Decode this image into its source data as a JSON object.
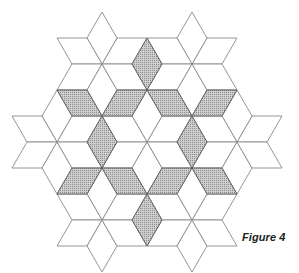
{
  "figure": {
    "caption": "Figure 4",
    "colors": {
      "background": "#ffffff",
      "outline": "#8a8a8a",
      "shade_fill": "#c9c9c9",
      "shade_dots": "#7d7d7d"
    },
    "star_centers_lattice": [
      [
        0,
        0
      ],
      [
        3,
        0
      ],
      [
        -3,
        3
      ],
      [
        0,
        3
      ],
      [
        3,
        3
      ],
      [
        -3,
        6
      ],
      [
        0,
        6
      ]
    ],
    "shaded_pairs": [
      [
        0,
        1
      ],
      [
        0,
        2
      ],
      [
        0,
        3
      ],
      [
        1,
        3
      ],
      [
        1,
        4
      ],
      [
        2,
        3
      ],
      [
        3,
        4
      ],
      [
        2,
        5
      ],
      [
        3,
        5
      ],
      [
        3,
        6
      ],
      [
        4,
        6
      ],
      [
        5,
        6
      ]
    ]
  }
}
